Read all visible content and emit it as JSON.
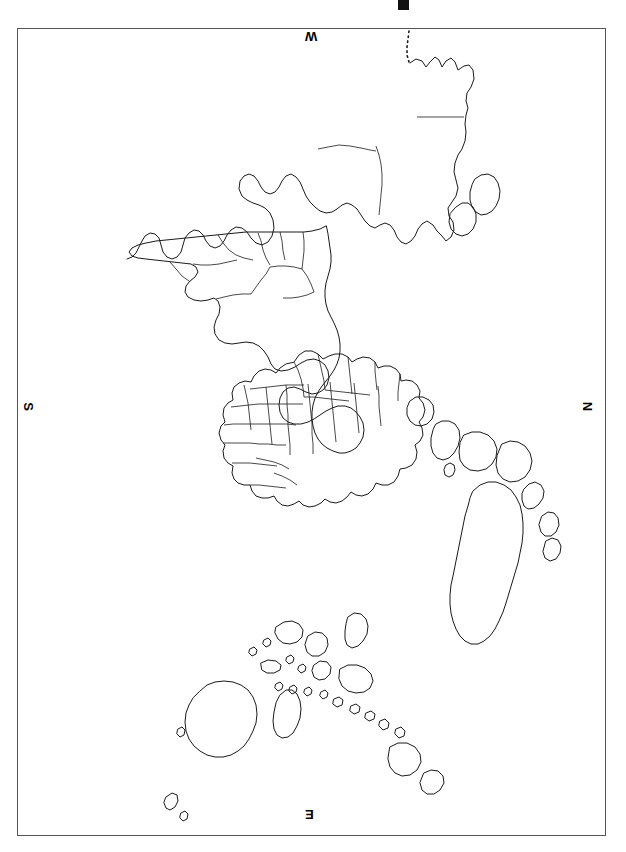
{
  "document": {
    "kind": "scanned-world-map",
    "orientation_note": "sheet rotated 90 degrees",
    "background_color": "#ffffff",
    "ink_color": "#1a1a1a"
  },
  "frame": {
    "border_color": "#555555",
    "x": 17,
    "y": 28,
    "width": 589,
    "height": 808
  },
  "marks": {
    "top_tick_color": "#111111"
  },
  "compass": {
    "top": "W",
    "right": "N",
    "bottom": "E",
    "left": "S"
  },
  "map_features": {
    "landmass_groups": [
      "north-america",
      "greenland",
      "south-america",
      "europe",
      "africa",
      "asia",
      "australia",
      "madagascar",
      "indonesian-archipelago",
      "antarctic-peninsula-islands"
    ],
    "has_internal_country_borders": true,
    "has_dotted_boundary": true
  }
}
